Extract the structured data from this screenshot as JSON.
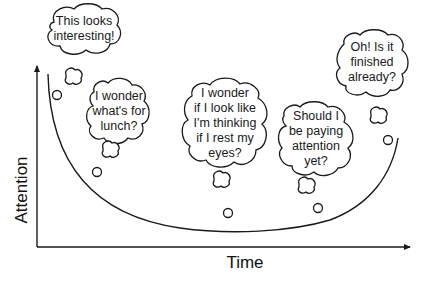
{
  "diagram": {
    "type": "attention-over-time cartoon",
    "axes": {
      "x_label": "Time",
      "y_label": "Attention"
    },
    "curve": {
      "description": "U-shaped attention curve: high at start, drops steeply, stays low, rises at the end"
    },
    "thought_bubbles": [
      {
        "id": "start",
        "text": "This looks\ninteresting!"
      },
      {
        "id": "lunch",
        "text": "I wonder\nwhat's for\nlunch?"
      },
      {
        "id": "eyes",
        "text": "I wonder\nif I look like\nI'm thinking\nif I rest my\neyes?"
      },
      {
        "id": "paying",
        "text": "Should I\nbe paying\nattention\nyet?"
      },
      {
        "id": "finished",
        "text": "Oh! Is it\nfinished\nalready?"
      }
    ]
  },
  "colors": {
    "background": "#ffffff",
    "stroke": "#1a1a1a"
  }
}
